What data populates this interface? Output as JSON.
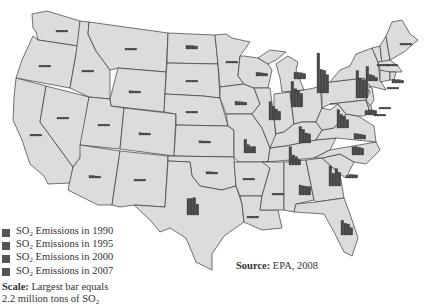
{
  "legend": {
    "items": [
      {
        "label_prefix": "SO",
        "sub": "2",
        "label_suffix": " Emissions in 1990"
      },
      {
        "label_prefix": "SO",
        "sub": "2",
        "label_suffix": " Emissions in 1995"
      },
      {
        "label_prefix": "SO",
        "sub": "2",
        "label_suffix": " Emissions in 2000"
      },
      {
        "label_prefix": "SO",
        "sub": "2",
        "label_suffix": " Emissions in 2007"
      }
    ],
    "swatch_color": "#555555",
    "scale_label": "Scale:",
    "scale_text_1": " Largest bar equals",
    "scale_text_2": "2.2 million tons of SO",
    "scale_sub": "2"
  },
  "source": {
    "label": "Source:",
    "text": " EPA, 2008"
  },
  "colors": {
    "land": "#dcdcdc",
    "border": "#3a3a3a",
    "bars": "#4a4a4a",
    "background": "#ffffff"
  },
  "chart_data": {
    "type": "bar",
    "series_names": [
      "1990",
      "1995",
      "2000",
      "2007"
    ],
    "unit": "million tons SO2",
    "scale_max": 2.2,
    "note": "Values estimated from bar heights; largest bar (Ohio 1990) = 2.2 million tons",
    "states": [
      {
        "state": "WA",
        "x": 62,
        "y": 29,
        "values": [
          0.1,
          0.08,
          0.08,
          0.05
        ]
      },
      {
        "state": "OR",
        "x": 45,
        "y": 64,
        "values": [
          0.05,
          0.04,
          0.04,
          0.03
        ]
      },
      {
        "state": "CA",
        "x": 36,
        "y": 133,
        "values": [
          0.08,
          0.06,
          0.05,
          0.04
        ]
      },
      {
        "state": "NV",
        "x": 63,
        "y": 116,
        "values": [
          0.09,
          0.08,
          0.07,
          0.06
        ]
      },
      {
        "state": "ID",
        "x": 88,
        "y": 69,
        "values": [
          0.03,
          0.03,
          0.03,
          0.02
        ]
      },
      {
        "state": "MT",
        "x": 131,
        "y": 47,
        "values": [
          0.06,
          0.05,
          0.05,
          0.04
        ]
      },
      {
        "state": "WY",
        "x": 135,
        "y": 90,
        "values": [
          0.12,
          0.11,
          0.11,
          0.1
        ]
      },
      {
        "state": "UT",
        "x": 104,
        "y": 123,
        "values": [
          0.08,
          0.07,
          0.06,
          0.05
        ]
      },
      {
        "state": "AZ",
        "x": 95,
        "y": 175,
        "values": [
          0.14,
          0.12,
          0.11,
          0.1
        ]
      },
      {
        "state": "CO",
        "x": 145,
        "y": 132,
        "values": [
          0.12,
          0.11,
          0.11,
          0.09
        ]
      },
      {
        "state": "NM",
        "x": 140,
        "y": 178,
        "values": [
          0.1,
          0.09,
          0.08,
          0.07
        ]
      },
      {
        "state": "ND",
        "x": 192,
        "y": 46,
        "values": [
          0.2,
          0.19,
          0.18,
          0.16
        ]
      },
      {
        "state": "SD",
        "x": 192,
        "y": 79,
        "values": [
          0.05,
          0.05,
          0.04,
          0.04
        ]
      },
      {
        "state": "NE",
        "x": 192,
        "y": 110,
        "values": [
          0.08,
          0.08,
          0.08,
          0.07
        ]
      },
      {
        "state": "KS",
        "x": 205,
        "y": 140,
        "values": [
          0.12,
          0.11,
          0.11,
          0.1
        ]
      },
      {
        "state": "OK",
        "x": 212,
        "y": 171,
        "values": [
          0.12,
          0.12,
          0.11,
          0.1
        ]
      },
      {
        "state": "TX",
        "x": 193,
        "y": 212,
        "values": [
          0.9,
          0.92,
          0.95,
          0.6
        ]
      },
      {
        "state": "MN",
        "x": 232,
        "y": 60,
        "values": [
          0.1,
          0.09,
          0.09,
          0.08
        ]
      },
      {
        "state": "IA",
        "x": 241,
        "y": 102,
        "values": [
          0.2,
          0.18,
          0.17,
          0.15
        ]
      },
      {
        "state": "MO",
        "x": 250,
        "y": 150,
        "values": [
          0.75,
          0.45,
          0.35,
          0.35
        ]
      },
      {
        "state": "AR",
        "x": 249,
        "y": 177,
        "values": [
          0.09,
          0.09,
          0.08,
          0.08
        ]
      },
      {
        "state": "LA",
        "x": 253,
        "y": 215,
        "values": [
          0.1,
          0.1,
          0.09,
          0.08
        ]
      },
      {
        "state": "WI",
        "x": 262,
        "y": 73,
        "values": [
          0.2,
          0.18,
          0.16,
          0.14
        ]
      },
      {
        "state": "IL",
        "x": 275,
        "y": 117,
        "values": [
          1.0,
          0.75,
          0.6,
          0.48
        ]
      },
      {
        "state": "MI",
        "x": 300,
        "y": 76,
        "values": [
          0.38,
          0.36,
          0.34,
          0.3
        ]
      },
      {
        "state": "IN",
        "x": 297,
        "y": 104,
        "values": [
          1.4,
          1.0,
          0.9,
          0.75
        ]
      },
      {
        "state": "OH",
        "x": 323,
        "y": 90,
        "values": [
          2.2,
          1.3,
          1.25,
          1.0
        ]
      },
      {
        "state": "KY",
        "x": 305,
        "y": 140,
        "values": [
          0.9,
          0.75,
          0.55,
          0.5
        ]
      },
      {
        "state": "TN",
        "x": 295,
        "y": 162,
        "values": [
          1.0,
          0.55,
          0.45,
          0.3
        ]
      },
      {
        "state": "MS",
        "x": 278,
        "y": 192,
        "values": [
          0.07,
          0.07,
          0.06,
          0.05
        ]
      },
      {
        "state": "AL",
        "x": 305,
        "y": 192,
        "values": [
          0.55,
          0.5,
          0.48,
          0.45
        ]
      },
      {
        "state": "GA",
        "x": 335,
        "y": 183,
        "values": [
          1.1,
          0.7,
          0.95,
          0.75
        ]
      },
      {
        "state": "FL",
        "x": 347,
        "y": 232,
        "values": [
          0.8,
          0.65,
          0.6,
          0.4
        ]
      },
      {
        "state": "SC",
        "x": 352,
        "y": 175,
        "values": [
          0.15,
          0.2,
          0.18,
          0.17
        ]
      },
      {
        "state": "NC",
        "x": 358,
        "y": 152,
        "values": [
          0.45,
          0.45,
          0.42,
          0.38
        ]
      },
      {
        "state": "VA",
        "x": 360,
        "y": 136,
        "values": [
          0.3,
          0.28,
          0.26,
          0.22
        ]
      },
      {
        "state": "WV",
        "x": 343,
        "y": 125,
        "values": [
          1.0,
          0.75,
          0.65,
          0.45
        ]
      },
      {
        "state": "PA",
        "x": 362,
        "y": 95,
        "values": [
          1.5,
          1.1,
          1.0,
          0.95
        ]
      },
      {
        "state": "NY",
        "x": 372,
        "y": 78,
        "values": [
          0.8,
          0.35,
          0.3,
          0.2
        ]
      },
      {
        "state": "VT",
        "x": 383,
        "y": 63,
        "values": [
          0.03,
          0.03,
          0.03,
          0.02
        ]
      },
      {
        "state": "NH",
        "x": 392,
        "y": 63,
        "values": [
          0.08,
          0.07,
          0.06,
          0.05
        ]
      },
      {
        "state": "ME",
        "x": 406,
        "y": 42,
        "values": [
          0.03,
          0.03,
          0.02,
          0.02
        ]
      },
      {
        "state": "MA",
        "x": 398,
        "y": 80,
        "values": [
          0.2,
          0.18,
          0.18,
          0.15
        ]
      },
      {
        "state": "CT",
        "x": 393,
        "y": 86,
        "values": [
          0.06,
          0.05,
          0.04,
          0.03
        ]
      },
      {
        "state": "NJ",
        "x": 385,
        "y": 106,
        "values": [
          0.08,
          0.07,
          0.06,
          0.05
        ]
      },
      {
        "state": "DE",
        "x": 380,
        "y": 113,
        "values": [
          0.09,
          0.08,
          0.07,
          0.05
        ]
      },
      {
        "state": "MD",
        "x": 371,
        "y": 112,
        "values": [
          0.25,
          0.28,
          0.28,
          0.25
        ]
      }
    ]
  }
}
